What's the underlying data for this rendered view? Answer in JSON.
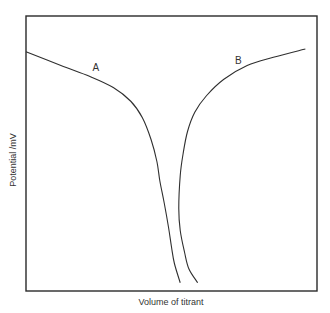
{
  "chart_data": {
    "type": "line",
    "title": "",
    "xlabel": "Volume of titrant",
    "ylabel": "Potential /mV",
    "xlim": [
      0,
      1
    ],
    "ylim": [
      0,
      1
    ],
    "grid": false,
    "legend": "none",
    "series": [
      {
        "name": "A",
        "label": "A",
        "x": [
          0.0,
          0.12,
          0.22,
          0.3,
          0.36,
          0.4,
          0.43,
          0.45,
          0.46,
          0.475,
          0.49,
          0.5,
          0.51,
          0.53
        ],
        "y": [
          0.87,
          0.82,
          0.78,
          0.74,
          0.69,
          0.63,
          0.55,
          0.47,
          0.4,
          0.32,
          0.23,
          0.16,
          0.1,
          0.03
        ]
      },
      {
        "name": "B",
        "label": "B",
        "x": [
          0.96,
          0.85,
          0.76,
          0.68,
          0.62,
          0.58,
          0.555,
          0.54,
          0.53,
          0.525,
          0.53,
          0.545,
          0.56,
          0.59
        ],
        "y": [
          0.88,
          0.85,
          0.82,
          0.77,
          0.71,
          0.65,
          0.58,
          0.5,
          0.42,
          0.3,
          0.22,
          0.14,
          0.08,
          0.03
        ]
      }
    ],
    "annotations": [
      {
        "text": "A",
        "x": 0.24,
        "y": 0.8
      },
      {
        "text": "B",
        "x": 0.73,
        "y": 0.825
      }
    ]
  }
}
